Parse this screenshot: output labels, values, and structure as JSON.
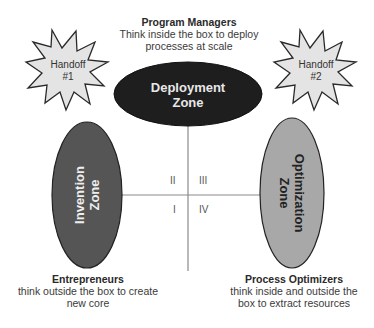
{
  "diagram": {
    "top_label": {
      "title": "Program Managers",
      "line1": "Think inside the box to deploy",
      "line2": "processes at scale"
    },
    "handoffs": [
      {
        "line1": "Handoff",
        "line2": "#1"
      },
      {
        "line1": "Handoff",
        "line2": "#2"
      }
    ],
    "zones": {
      "deployment": {
        "line1": "Deployment",
        "line2": "Zone",
        "fill": "#1e1e1e",
        "text_color": "#e8e8e8"
      },
      "invention": {
        "line1": "Invention",
        "line2": "Zone",
        "fill": "#555555",
        "text_color": "#eeeeee"
      },
      "optimization": {
        "line1": "Optimization",
        "line2": "Zone",
        "fill": "#a8a8a8",
        "text_color": "#222222"
      }
    },
    "quadrants": {
      "q1": "I",
      "q2": "II",
      "q3": "III",
      "q4": "IV"
    },
    "bottom_left": {
      "title": "Entrepreneurs",
      "line1": "think outside the box to create",
      "line2": "new core"
    },
    "bottom_right": {
      "title": "Process Optimizers",
      "line1": "think inside and outside the",
      "line2": "box to extract resources"
    }
  }
}
